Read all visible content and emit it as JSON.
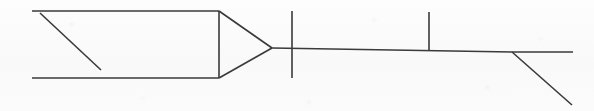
{
  "document": {
    "title": "Line Drawing",
    "subject": "technical-line-diagram",
    "background_color": "#fbfbfb",
    "ink_color": "#3a3a3a",
    "width": 594,
    "height": 111
  },
  "drawing": {
    "stroke_color": "#3a3a3a",
    "stroke_width": 1.6,
    "shapes": {
      "body_top_edge": {
        "name": "body-top-edge",
        "points": "32,11 219,11"
      },
      "body_bottom_edge": {
        "name": "body-bottom-edge",
        "points": "32,78 219,78"
      },
      "body_right_edge": {
        "name": "body-right-edge",
        "points": "219,11 219,78"
      },
      "interior_diagonal": {
        "name": "interior-diagonal",
        "points": "40,13 101,70"
      },
      "arrow_head_upper": {
        "name": "arrow-head-upper-edge",
        "points": "219,11 272,48"
      },
      "arrow_head_lower": {
        "name": "arrow-head-lower-edge",
        "points": "219,78 272,48"
      },
      "axis_line": {
        "name": "horizontal-axis-line",
        "points": "272,48 512,52 573,52"
      },
      "tick_first": {
        "name": "tick-mark-first",
        "points": "292,11 292,78"
      },
      "tick_second": {
        "name": "tick-mark-second",
        "points": "429,12 429,50"
      },
      "branch_diagonal": {
        "name": "branch-diagonal",
        "points": "512,52 572,105"
      }
    }
  },
  "labels": {
    "visible_text": []
  }
}
